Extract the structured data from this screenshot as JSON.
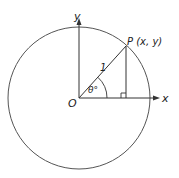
{
  "diagram": {
    "type": "unit-circle",
    "labels": {
      "origin": "O",
      "x_axis": "x",
      "y_axis": "y",
      "point": "P (x, y)",
      "radius": "1",
      "angle": "θ°"
    },
    "colors": {
      "stroke": "#444444",
      "background": "#ffffff"
    }
  }
}
